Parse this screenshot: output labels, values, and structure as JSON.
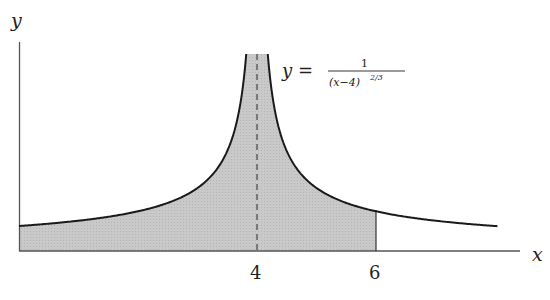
{
  "figure": {
    "axes": {
      "x_label": "x",
      "y_label": "y"
    },
    "ticks": [
      {
        "value": 4,
        "label": "4"
      },
      {
        "value": 6,
        "label": "6"
      }
    ],
    "equation": {
      "lhs": "y =",
      "numerator": "1",
      "denominator": "(x−4)",
      "exponent": "2/3"
    },
    "asymptote_x": 4,
    "shaded_interval": [
      0,
      6
    ],
    "colors": {
      "shade": "#c8c8c8",
      "curve": "#1a1a1a",
      "axis": "#555555"
    }
  },
  "chart_data": {
    "type": "area",
    "title": "",
    "function": "y = 1/(x-4)^(2/3)",
    "xlabel": "x",
    "ylabel": "y",
    "x_ticks": [
      4,
      6
    ],
    "vertical_asymptote": 4,
    "shaded_region": {
      "from": 0,
      "to": 6
    },
    "xlim": [
      0,
      8.1
    ],
    "grid": false,
    "samples": [
      {
        "x": 0,
        "y": 0.397
      },
      {
        "x": 2,
        "y": 0.63
      },
      {
        "x": 3,
        "y": 1.0
      },
      {
        "x": 3.8,
        "y": 2.92
      },
      {
        "x": 4.2,
        "y": 2.92
      },
      {
        "x": 5,
        "y": 1.0
      },
      {
        "x": 6,
        "y": 0.63
      },
      {
        "x": 8,
        "y": 0.397
      }
    ]
  }
}
